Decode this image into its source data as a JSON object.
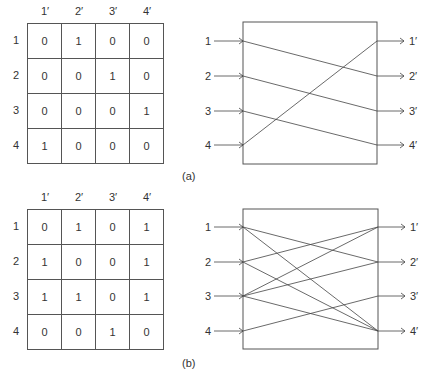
{
  "figures": [
    {
      "id": "a",
      "caption": "(a)",
      "column_labels": [
        "1′",
        "2′",
        "3′",
        "4′"
      ],
      "row_labels": [
        "1",
        "2",
        "3",
        "4"
      ],
      "matrix": [
        [
          "0",
          "1",
          "0",
          "0"
        ],
        [
          "0",
          "0",
          "1",
          "0"
        ],
        [
          "0",
          "0",
          "0",
          "1"
        ],
        [
          "1",
          "0",
          "0",
          "0"
        ]
      ],
      "inputs": [
        "1",
        "2",
        "3",
        "4"
      ],
      "outputs": [
        "1′",
        "2′",
        "3′",
        "4′"
      ],
      "connections": [
        [
          1,
          2
        ],
        [
          2,
          3
        ],
        [
          3,
          4
        ],
        [
          4,
          1
        ]
      ]
    },
    {
      "id": "b",
      "caption": "(b)",
      "column_labels": [
        "1′",
        "2′",
        "3′",
        "4′"
      ],
      "row_labels": [
        "1",
        "2",
        "3",
        "4"
      ],
      "matrix": [
        [
          "0",
          "1",
          "0",
          "1"
        ],
        [
          "1",
          "0",
          "0",
          "1"
        ],
        [
          "1",
          "1",
          "0",
          "1"
        ],
        [
          "0",
          "0",
          "1",
          "0"
        ]
      ],
      "inputs": [
        "1",
        "2",
        "3",
        "4"
      ],
      "outputs": [
        "1′",
        "2′",
        "3′",
        "4′"
      ],
      "connections": [
        [
          1,
          2
        ],
        [
          1,
          4
        ],
        [
          2,
          1
        ],
        [
          2,
          4
        ],
        [
          3,
          1
        ],
        [
          3,
          2
        ],
        [
          3,
          4
        ],
        [
          4,
          3
        ]
      ]
    }
  ],
  "colors": {
    "line": "#444444",
    "text": "#333333",
    "grid": "#555555"
  }
}
